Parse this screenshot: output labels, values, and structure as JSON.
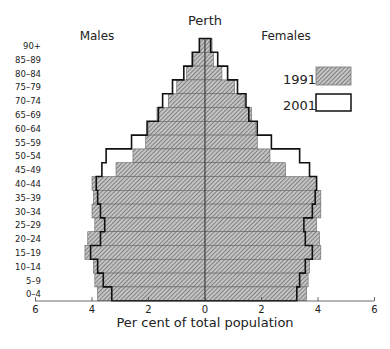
{
  "chart_data": {
    "type": "bar",
    "subtype": "population-pyramid",
    "title": "Perth",
    "left_label": "Males",
    "right_label": "Females",
    "xlabel": "Per cent of total population",
    "ylabel": "",
    "xlim": [
      -6,
      6
    ],
    "x_ticks": [
      6,
      4,
      2,
      0,
      2,
      4,
      6
    ],
    "grid": false,
    "legend_position": "upper right",
    "categories": [
      "90+",
      "85–89",
      "80–84",
      "75–79",
      "70–74",
      "65–69",
      "60–64",
      "55–59",
      "50–54",
      "45–49",
      "40–44",
      "35–39",
      "30–34",
      "25–29",
      "20–24",
      "15–19",
      "10–14",
      "5–9",
      "0–4"
    ],
    "series": [
      {
        "name": "1991",
        "style": "hatched",
        "males": [
          0.2,
          0.4,
          0.65,
          1.0,
          1.3,
          1.7,
          2.0,
          2.1,
          2.55,
          3.15,
          4.0,
          3.95,
          4.0,
          3.9,
          4.15,
          4.25,
          3.95,
          3.9,
          3.8
        ],
        "females": [
          0.25,
          0.3,
          0.6,
          1.05,
          1.4,
          1.65,
          1.8,
          1.85,
          2.3,
          2.85,
          3.95,
          4.1,
          4.1,
          3.95,
          4.05,
          4.1,
          3.7,
          3.65,
          3.6
        ]
      },
      {
        "name": "2001",
        "style": "outline",
        "males": [
          0.2,
          0.45,
          0.75,
          1.15,
          1.5,
          1.65,
          2.05,
          2.6,
          3.5,
          3.65,
          3.85,
          3.8,
          3.7,
          3.55,
          3.7,
          4.05,
          3.8,
          3.6,
          3.3
        ],
        "females": [
          0.2,
          0.45,
          0.8,
          1.15,
          1.45,
          1.55,
          1.85,
          2.35,
          3.35,
          3.7,
          3.95,
          3.9,
          3.8,
          3.5,
          3.55,
          3.8,
          3.55,
          3.35,
          3.25
        ]
      }
    ],
    "legend": [
      {
        "label": "1991",
        "style": "hatched"
      },
      {
        "label": "2001",
        "style": "outline"
      }
    ]
  },
  "colors": {
    "hatch_fill": "#b8b8b8",
    "hatch_line": "#555555",
    "outline": "#111111",
    "axis": "#444444"
  }
}
